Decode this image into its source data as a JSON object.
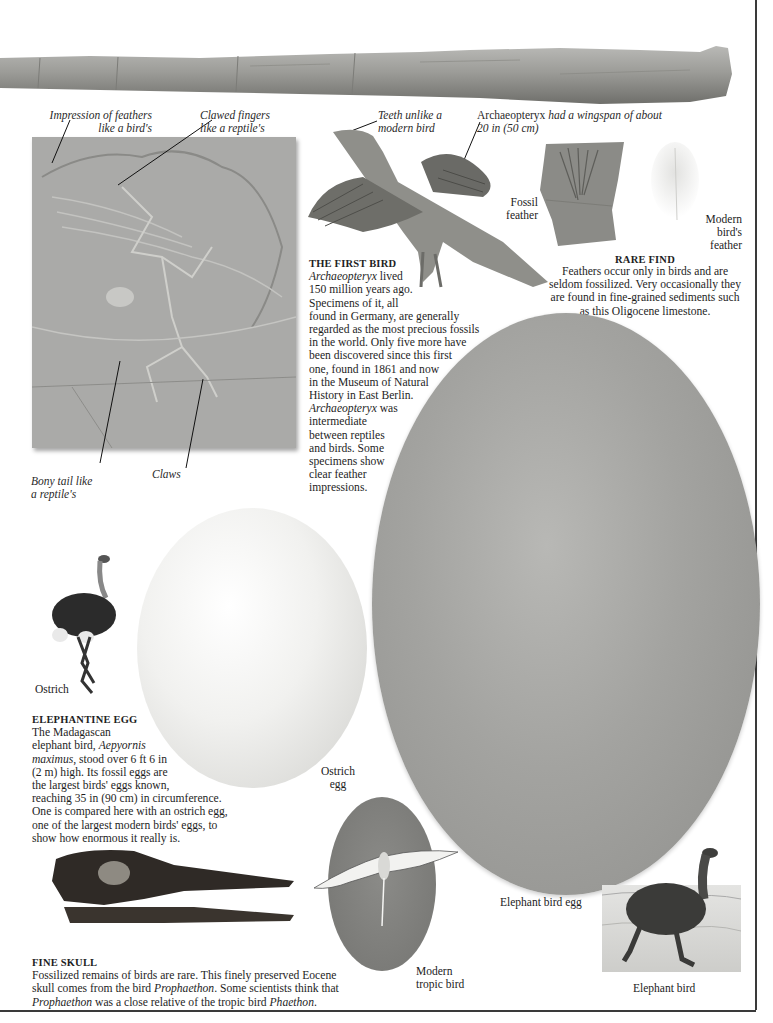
{
  "page": {
    "background": "#ffffff",
    "frame_color": "#3a3a3a"
  },
  "bone": {
    "name": "fossil-bone"
  },
  "archaeopteryx_fossil": {
    "callouts": {
      "feathers": [
        "Impression of feathers",
        "like a bird's"
      ],
      "fingers": [
        "Clawed fingers",
        "like a reptile's"
      ],
      "tail": [
        "Bony tail like",
        "a reptile's"
      ],
      "claws": "Claws"
    }
  },
  "reconstruction": {
    "callouts": {
      "teeth": [
        "Teeth unlike a",
        "modern bird"
      ],
      "wingspan_name": "Archaeopteryx",
      "wingspan_rest": " had a wingspan of about",
      "wingspan_line2": "20 in (50 cm)"
    }
  },
  "first_bird": {
    "heading": "THE FIRST BIRD",
    "lines": [
      {
        "it": "Archaeopteryx",
        "rest": " lived"
      },
      {
        "it": "",
        "rest": "150 million years ago."
      },
      {
        "it": "",
        "rest": "Specimens of it, all"
      },
      {
        "it": "",
        "rest": "found in Germany, are generally"
      },
      {
        "it": "",
        "rest": "regarded as the most precious fossils"
      },
      {
        "it": "",
        "rest": "in the world. Only five more have"
      },
      {
        "it": "",
        "rest": "been discovered since this first"
      },
      {
        "it": "",
        "rest": "one, found in 1861 and now"
      },
      {
        "it": "",
        "rest": "in the Museum of Natural"
      },
      {
        "it": "",
        "rest": "History in East Berlin."
      },
      {
        "it": "Archaeopteryx",
        "rest": " was"
      },
      {
        "it": "",
        "rest": "intermediate"
      },
      {
        "it": "",
        "rest": "between reptiles"
      },
      {
        "it": "",
        "rest": "and birds. Some"
      },
      {
        "it": "",
        "rest": "specimens show"
      },
      {
        "it": "",
        "rest": "clear feather"
      },
      {
        "it": "",
        "rest": "impressions."
      }
    ]
  },
  "feathers": {
    "fossil_label": [
      "Fossil",
      "feather"
    ],
    "modern_label": [
      "Modern",
      "bird's",
      "feather"
    ]
  },
  "rare_find": {
    "heading": "RARE FIND",
    "lines": [
      "Feathers occur only in birds and are",
      "seldom fossilized. Very occasionally they",
      "are found in fine-grained sediments such",
      "as this Oligocene limestone."
    ]
  },
  "ostrich": {
    "label": "Ostrich",
    "egg_label": [
      "Ostrich",
      "egg"
    ]
  },
  "elephantine_egg": {
    "heading": "ELEPHANTINE EGG",
    "lines": [
      {
        "pre": "The Madagascan",
        "it": "",
        "post": ""
      },
      {
        "pre": "elephant bird, ",
        "it": "Aepyornis",
        "post": ""
      },
      {
        "pre": "",
        "it": "maximus",
        "post": ", stood over 6 ft 6 in"
      },
      {
        "pre": "(2 m) high. Its fossil eggs are",
        "it": "",
        "post": ""
      },
      {
        "pre": "the largest birds' eggs known,",
        "it": "",
        "post": ""
      },
      {
        "pre": "reaching 35 in (90 cm) in circumference.",
        "it": "",
        "post": ""
      },
      {
        "pre": "One is compared here with an ostrich egg,",
        "it": "",
        "post": ""
      },
      {
        "pre": "one of the largest modern birds' eggs, to",
        "it": "",
        "post": ""
      },
      {
        "pre": "show how enormous it really is.",
        "it": "",
        "post": ""
      }
    ]
  },
  "elephant_bird": {
    "egg_label": "Elephant bird egg",
    "label": "Elephant bird"
  },
  "tropic_bird": {
    "label": [
      "Modern",
      "tropic bird"
    ]
  },
  "fine_skull": {
    "heading": "FINE SKULL",
    "lines": [
      {
        "pre": "Fossilized remains of birds are rare. This finely preserved Eocene",
        "it": "",
        "post": ""
      },
      {
        "pre": "skull comes from the bird ",
        "it": "Prophaethon",
        "post": ". Some scientists think that"
      },
      {
        "pre": "",
        "it": "Prophaethon",
        "post": " was a close relative of the tropic bird ",
        "it2": "Phaethon",
        "post2": "."
      }
    ]
  }
}
